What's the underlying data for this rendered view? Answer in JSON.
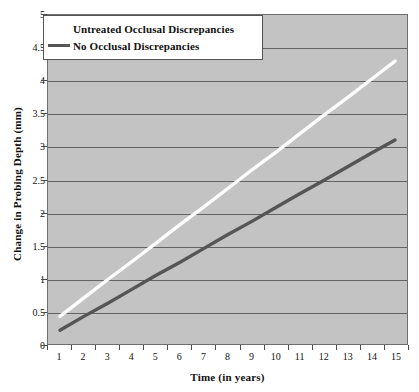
{
  "chart_data": {
    "type": "line",
    "title": "",
    "xlabel": "Time (in years)",
    "ylabel": "Change in Probing Depth (mm)",
    "xlim": [
      1,
      15
    ],
    "ylim": [
      0,
      5
    ],
    "grid": true,
    "legend_position": "top-left",
    "x": [
      1,
      2,
      3,
      4,
      5,
      6,
      7,
      8,
      9,
      10,
      11,
      12,
      13,
      14,
      15
    ],
    "xtick_labels": [
      "1",
      "2",
      "3",
      "4",
      "5",
      "6",
      "7",
      "8",
      "9",
      "10",
      "11",
      "12",
      "13",
      "14",
      "15"
    ],
    "ytick_labels": [
      "0",
      "0.5",
      "1",
      "1.5",
      "2",
      "2.5",
      "3",
      "3.5",
      "4",
      "4.5",
      "5"
    ],
    "ytick_values": [
      0,
      0.5,
      1,
      1.5,
      2,
      2.5,
      3,
      3.5,
      4,
      4.5,
      5
    ],
    "series": [
      {
        "name": "Untreated Occlusal Discrepancies",
        "color": "#ffffff",
        "values": [
          0.42,
          0.7,
          0.98,
          1.25,
          1.53,
          1.81,
          2.08,
          2.36,
          2.64,
          2.91,
          3.19,
          3.47,
          3.74,
          4.02,
          4.3
        ]
      },
      {
        "name": "No Occlusal Discrepancies",
        "color": "#555555",
        "values": [
          0.21,
          0.42,
          0.62,
          0.83,
          1.04,
          1.24,
          1.45,
          1.66,
          1.86,
          2.07,
          2.28,
          2.48,
          2.69,
          2.9,
          3.1
        ]
      }
    ]
  },
  "legend": {
    "items": [
      {
        "label": "Untreated Occlusal Discrepancies",
        "color": "#ffffff"
      },
      {
        "label": "No Occlusal Discrepancies",
        "color": "#555555"
      }
    ]
  },
  "colors": {
    "plot_background": "#c3c3c3",
    "gridline": "#636363",
    "axis": "#6f6f6f",
    "page_background": "#ffffff",
    "text": "#111111"
  }
}
